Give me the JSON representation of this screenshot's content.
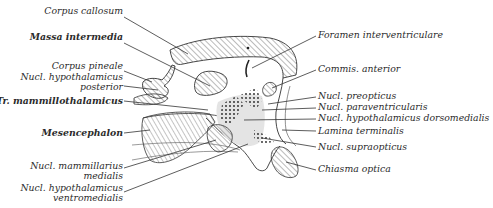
{
  "diagram": {
    "left_labels": [
      {
        "id": "corpus-callosum",
        "lines": [
          "Corpus callosum"
        ],
        "x": 123,
        "y": 10
      },
      {
        "id": "massa-intermedia",
        "lines": [
          "Massa intermedia"
        ],
        "x": 123,
        "y": 36
      },
      {
        "id": "corpus-pineale",
        "lines": [
          "Corpus pineale"
        ],
        "x": 123,
        "y": 63
      },
      {
        "id": "nucl-hypothalamicus-posterior",
        "lines": [
          "Nucl. hypothalamicus",
          "posterior"
        ],
        "x": 123,
        "y": 75
      },
      {
        "id": "tr-mammillothalamicus",
        "lines": [
          "Tr. mammillothalamicus"
        ],
        "x": 123,
        "y": 97
      },
      {
        "id": "mesencephalon",
        "lines": [
          "Mesencephalon"
        ],
        "x": 123,
        "y": 125
      },
      {
        "id": "nucl-mammillarius-medialis",
        "lines": [
          "Nucl. mammillarius",
          "medialis"
        ],
        "x": 123,
        "y": 158
      },
      {
        "id": "nucl-hypothalamicus-ventromedialis",
        "lines": [
          "Nucl. hypothalamicus",
          "ventromedialis"
        ],
        "x": 123,
        "y": 182
      }
    ],
    "right_labels": [
      {
        "id": "foramen-interventriculare",
        "lines": [
          "Foramen interventriculare"
        ],
        "x": 317,
        "y": 31
      },
      {
        "id": "commis-anterior",
        "lines": [
          "Commis. anterior"
        ],
        "x": 317,
        "y": 65
      },
      {
        "id": "nucl-preopticus",
        "lines": [
          "Nucl. preopticus"
        ],
        "x": 317,
        "y": 92
      },
      {
        "id": "nucl-paraventricularis",
        "lines": [
          "Nucl. paraventricularis"
        ],
        "x": 317,
        "y": 103
      },
      {
        "id": "nucl-hypothalamicus-dorsomedialis",
        "lines": [
          "Nucl. hypothalamicus dorsomedialis"
        ],
        "x": 317,
        "y": 114
      },
      {
        "id": "lamina-terminalis",
        "lines": [
          "Lamina terminalis"
        ],
        "x": 317,
        "y": 127
      },
      {
        "id": "nucl-supraopticus",
        "lines": [
          "Nucl. supraopticus"
        ],
        "x": 317,
        "y": 143
      },
      {
        "id": "chiasma-optica",
        "lines": [
          "Chiasma optica"
        ],
        "x": 317,
        "y": 165
      }
    ],
    "colors": {
      "ink": "#2b2b2b",
      "hatch": "#555555",
      "shade": "#e4e4e4",
      "background": "#ffffff"
    }
  }
}
